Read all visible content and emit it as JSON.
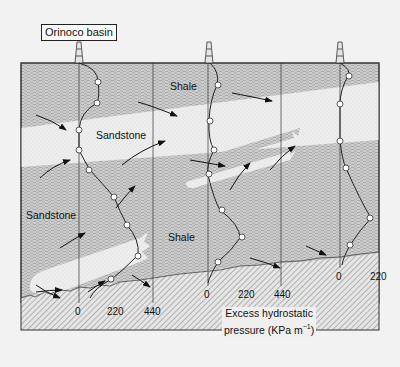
{
  "title": "Orinoco basin",
  "layers": {
    "shale_top": "Shale",
    "sandstone_upper": "Sandstone",
    "sandstone_lower": "Sandstone",
    "shale_lower": "Shale"
  },
  "wells": [
    {
      "id": "well-1",
      "axis_ticks": [
        "0",
        "220",
        "440"
      ]
    },
    {
      "id": "well-2",
      "axis_ticks": [
        "0",
        "220",
        "440"
      ]
    },
    {
      "id": "well-3",
      "axis_ticks": [
        "0",
        "220"
      ]
    }
  ],
  "axis_caption_line1": "Excess hydrostatic",
  "axis_caption_line2": "pressure (KPa m",
  "axis_caption_sup": "−1",
  "axis_caption_end": ")",
  "colors": {
    "shale_fill": "#c8c8c8",
    "sandstone_fill": "#ececec",
    "basement_hatch": "#777777",
    "line": "#222222"
  }
}
